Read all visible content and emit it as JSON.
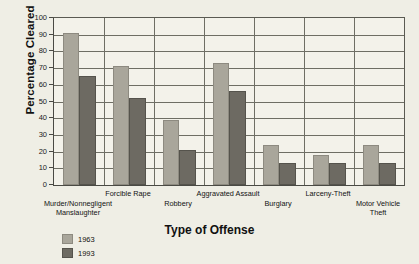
{
  "chart_data": {
    "type": "bar",
    "title": "",
    "xlabel": "Type of Offense",
    "ylabel": "Percentage Cleared",
    "ylim": [
      0,
      100
    ],
    "ytick_step": 10,
    "yticks": [
      "100",
      "90",
      "80",
      "70",
      "60",
      "50",
      "40",
      "30",
      "20",
      "10",
      "0"
    ],
    "grid": true,
    "legend_position": "bottom-left",
    "categories": [
      "Murder/Nonnegligent Manslaughter",
      "Forcible Rape",
      "Robbery",
      "Aggravated Assault",
      "Burglary",
      "Larceny-Theft",
      "Motor Vehicle Theft"
    ],
    "category_label_lines": [
      [
        "Murder/Nonnegligent",
        "Manslaughter"
      ],
      [
        "Forcible Rape"
      ],
      [
        "Robbery"
      ],
      [
        "Aggravated Assault"
      ],
      [
        "Burglary"
      ],
      [
        "Larceny-Theft"
      ],
      [
        "Motor Vehicle",
        "Theft"
      ]
    ],
    "series": [
      {
        "name": "1963",
        "color": "#a9a69b",
        "values": [
          91,
          71,
          39,
          73,
          24,
          18,
          24
        ]
      },
      {
        "name": "1993",
        "color": "#6d6a62",
        "values": [
          65,
          52,
          21,
          56,
          13,
          13,
          13
        ]
      }
    ]
  },
  "legend": {
    "entries": [
      {
        "label": "1963"
      },
      {
        "label": "1993"
      }
    ]
  }
}
